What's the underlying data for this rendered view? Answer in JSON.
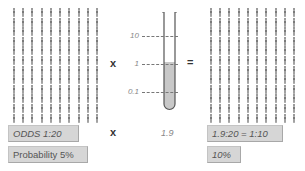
{
  "left_grid": {
    "rows": 12,
    "cols": 10,
    "icon": "person-icon",
    "color": "#7a7a7a"
  },
  "right_grid": {
    "rows": 12,
    "cols": 10,
    "icon": "person-icon",
    "color": "#7a7a7a"
  },
  "operators": {
    "multiply_top": "x",
    "equals": "=",
    "multiply_bottom": "x"
  },
  "test_tube": {
    "scale_labels": {
      "high": "10",
      "mid": "1",
      "low": "0.1"
    },
    "fill_color": "#c8c8c8",
    "fill_level_label": "1"
  },
  "likelihood_value": "1.9",
  "left_boxes": {
    "odds": "ODDS 1:20",
    "probability": "Probability 5%"
  },
  "right_boxes": {
    "odds": "1.9:20 = 1:10",
    "probability": "10%"
  },
  "chart_data": {
    "type": "diagram",
    "title": "",
    "pre_test_odds": "1:20",
    "pre_test_probability": "5%",
    "likelihood_ratio": 1.9,
    "likelihood_scale": [
      10,
      1,
      0.1
    ],
    "post_test_odds": "1.9:20 = 1:10",
    "post_test_probability": "10%"
  }
}
